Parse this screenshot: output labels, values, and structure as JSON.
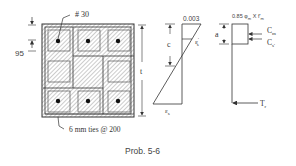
{
  "figure": {
    "caption": "Prob.  5-6",
    "colors": {
      "line": "#333333",
      "hatch": "#8a8a8a",
      "bar": "#111111",
      "background": "#ffffff"
    }
  },
  "section": {
    "bar_label": "# 30",
    "cover_dim": "95",
    "depth_label": "t",
    "ties_label": "6 mm ties @ 200",
    "bars_count": 6
  },
  "strain_diagram": {
    "top_strain": "0.003",
    "neutral_axis_label": "c",
    "compression_steel_strain": "ε",
    "compression_steel_strain_sup": "'",
    "compression_steel_strain_sub": "s",
    "tension_steel_strain": "ε",
    "tension_steel_strain_sub": "s"
  },
  "stress_diagram": {
    "stress_label": "0.85 φ",
    "stress_label_sub": "m",
    "stress_label_rest": " X f'",
    "stress_label_sub2": "m",
    "block_depth_label": "a",
    "concrete_force": "C",
    "concrete_force_sub": "m",
    "steel_comp_force": "C",
    "steel_comp_force_sub": "s'",
    "tension_force": "T",
    "tension_force_sub": "r"
  }
}
